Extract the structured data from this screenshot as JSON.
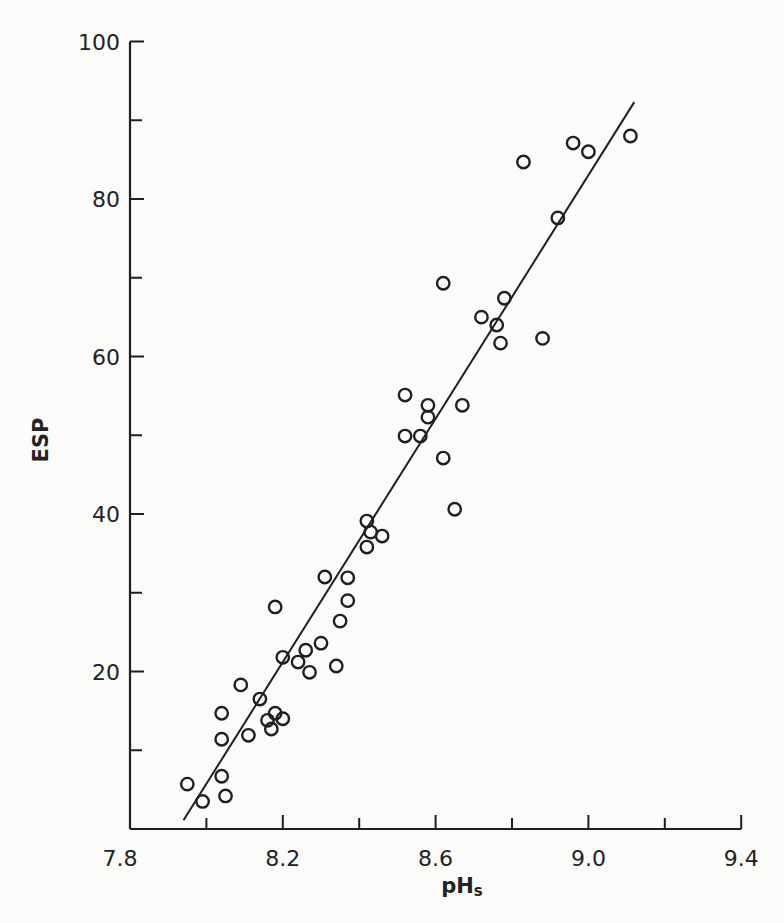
{
  "chart_data": {
    "type": "scatter",
    "title": "",
    "xlabel": "pHs",
    "xlabel_main": "pH",
    "xlabel_sub": "s",
    "ylabel": "ESP",
    "xlim": [
      7.8,
      9.4
    ],
    "ylim": [
      0,
      100
    ],
    "x_ticks_major": [
      7.8,
      8.2,
      8.6,
      9.0,
      9.4
    ],
    "x_tick_labels": [
      "7.8",
      "8.2",
      "8.6",
      "9.0",
      "9.4"
    ],
    "x_ticks_minor": [
      8.0,
      8.4,
      8.8,
      9.2
    ],
    "y_ticks_major": [
      20,
      40,
      60,
      80,
      100
    ],
    "y_tick_labels": [
      "20",
      "40",
      "60",
      "80",
      "100"
    ],
    "y_ticks_minor": [
      10,
      30,
      50,
      70,
      90
    ],
    "grid": false,
    "legend": null,
    "marker": "open-circle",
    "series": [
      {
        "name": "observations",
        "points": [
          [
            7.95,
            5.7
          ],
          [
            7.99,
            3.5
          ],
          [
            8.04,
            6.7
          ],
          [
            8.05,
            4.2
          ],
          [
            8.04,
            11.4
          ],
          [
            8.04,
            14.7
          ],
          [
            8.09,
            18.3
          ],
          [
            8.11,
            11.9
          ],
          [
            8.14,
            16.5
          ],
          [
            8.16,
            13.8
          ],
          [
            8.17,
            12.7
          ],
          [
            8.18,
            14.7
          ],
          [
            8.2,
            14.0
          ],
          [
            8.18,
            28.2
          ],
          [
            8.2,
            21.8
          ],
          [
            8.24,
            21.2
          ],
          [
            8.26,
            22.7
          ],
          [
            8.27,
            19.9
          ],
          [
            8.3,
            23.6
          ],
          [
            8.31,
            32.0
          ],
          [
            8.34,
            20.7
          ],
          [
            8.35,
            26.4
          ],
          [
            8.37,
            29.0
          ],
          [
            8.37,
            31.9
          ],
          [
            8.42,
            39.1
          ],
          [
            8.42,
            35.8
          ],
          [
            8.43,
            37.7
          ],
          [
            8.46,
            37.2
          ],
          [
            8.52,
            55.1
          ],
          [
            8.52,
            49.9
          ],
          [
            8.56,
            49.9
          ],
          [
            8.58,
            53.8
          ],
          [
            8.58,
            52.3
          ],
          [
            8.62,
            47.1
          ],
          [
            8.67,
            53.8
          ],
          [
            8.65,
            40.6
          ],
          [
            8.62,
            69.3
          ],
          [
            8.72,
            65.0
          ],
          [
            8.76,
            64.0
          ],
          [
            8.77,
            61.7
          ],
          [
            8.78,
            67.4
          ],
          [
            8.88,
            62.3
          ],
          [
            8.92,
            77.6
          ],
          [
            8.83,
            84.7
          ],
          [
            8.96,
            87.1
          ],
          [
            9.0,
            86.0
          ],
          [
            9.11,
            88.0
          ]
        ]
      },
      {
        "name": "regression-line",
        "type": "line",
        "points": [
          [
            7.94,
            1.1
          ],
          [
            9.12,
            92.3
          ]
        ]
      }
    ]
  },
  "colors": {
    "ink": "#1f1f1f",
    "background": "#fbfbf9"
  }
}
